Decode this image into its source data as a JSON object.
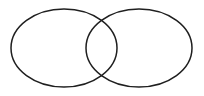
{
  "diagram": {
    "type": "venn-diagram",
    "background": "#ffffff",
    "stroke_color": "#1f1f1f",
    "stroke_width": 1.5,
    "canvas": {
      "width": 204,
      "height": 96
    },
    "ellipses": [
      {
        "name": "left-set-ellipse",
        "cx": 64,
        "cy": 48,
        "rx": 53,
        "ry": 39
      },
      {
        "name": "right-set-ellipse",
        "cx": 139,
        "cy": 48,
        "rx": 53,
        "ry": 39
      }
    ]
  }
}
